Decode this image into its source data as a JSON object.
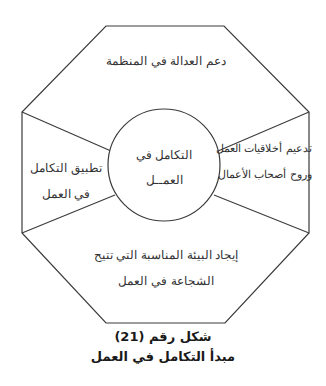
{
  "diagram": {
    "center": {
      "line1": "التكامل في",
      "line2": "العمــل"
    },
    "segments": {
      "top": {
        "line1": "دعم العدالة في المنظمة"
      },
      "right": {
        "line1": "تدعيم أخلاقيات العمل",
        "line2": "وروح أصحاب الأعمال"
      },
      "bottom": {
        "line1": "إيجاد البيئة المناسبة التي تتيح",
        "line2": "الشجاعة في العمل"
      },
      "left": {
        "line1": "تطبيق التكامل",
        "line2": "في العمل"
      }
    },
    "colors": {
      "stroke": "#3a3a3a",
      "background": "#ffffff"
    }
  },
  "caption": {
    "figure_number": "شكل رقم (21)",
    "title": "مبدأ التكامل في العمل"
  }
}
